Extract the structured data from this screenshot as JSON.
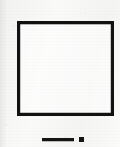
{
  "figure": {
    "medium": "scanned line drawing",
    "canvas": {
      "width": 120,
      "height": 147
    },
    "colors": {
      "paper": "#f7f7f5",
      "ink": "#121212",
      "ink_secondary": "#141414",
      "interior": "#ffffff"
    }
  },
  "shapes": {
    "square": {
      "name": "square",
      "stroke_color": "#121212",
      "stroke_width_px": 3,
      "fill": "none",
      "left_px": 17,
      "top_px": 21,
      "width_px": 97,
      "height_px": 95
    },
    "scale_bar": {
      "name": "scale-bar",
      "line": {
        "left_px": 42,
        "top_px": 138,
        "width_px": 32,
        "height_px": 3,
        "color": "#141414"
      },
      "dot": {
        "left_px": 79,
        "width_px": 5,
        "height_px": 5,
        "color": "#141414"
      }
    }
  },
  "labels": {
    "square_label": "",
    "scale_bar_label": "",
    "caption": ""
  }
}
